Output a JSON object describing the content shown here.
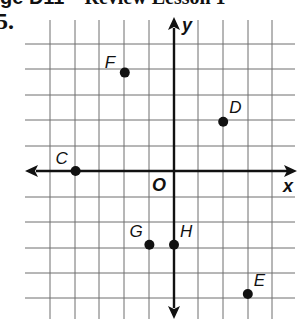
{
  "header": {
    "lead": "ge D11",
    "dash": " – ",
    "title": "Review Lesson 1"
  },
  "problem_number": "5.",
  "grid": {
    "x_lines": [
      50,
      75,
      99,
      124,
      149,
      174,
      198,
      223,
      248,
      272
    ],
    "y_lines": [
      44,
      69,
      95,
      120,
      146,
      171,
      197,
      222,
      248,
      273,
      298
    ],
    "origin_px": [
      174,
      171
    ],
    "unit_px": 24.6
  },
  "axes": {
    "x_label": "x",
    "y_label": "y",
    "origin_label": "O"
  },
  "points": [
    {
      "label": "F",
      "x": -2,
      "y": 4
    },
    {
      "label": "D",
      "x": 2,
      "y": 2
    },
    {
      "label": "C",
      "x": -4,
      "y": 0
    },
    {
      "label": "G",
      "x": -1,
      "y": -3
    },
    {
      "label": "H",
      "x": 0,
      "y": -3
    },
    {
      "label": "E",
      "x": 3,
      "y": -5
    }
  ],
  "colors": {
    "grid": "#6e6e6e",
    "axis": "#111111",
    "point": "#111111"
  }
}
